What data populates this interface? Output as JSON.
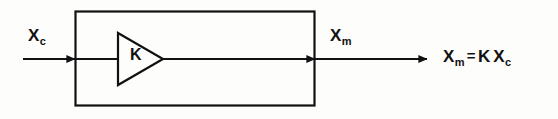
{
  "diagram": {
    "type": "block-diagram",
    "background_color": "#fdfdfc",
    "stroke_color": "#111111",
    "input": {
      "label_base": "X",
      "label_sub": "c",
      "label_full": "X_c",
      "arrow_direction": "right"
    },
    "block": {
      "shape": "rectangle",
      "x": 75,
      "y": 11,
      "width": 240,
      "height": 95,
      "element": {
        "shape": "triangle",
        "semantic": "amplifier",
        "gain_symbol": "K"
      }
    },
    "output": {
      "label_base": "X",
      "label_sub": "m",
      "label_full": "X_m",
      "arrow_direction": "right"
    },
    "equation": {
      "lhs_base": "X",
      "lhs_sub": "m",
      "operator": "=",
      "gain": "K",
      "rhs_base": "X",
      "rhs_sub": "c",
      "full": "X_m = K X_c"
    }
  }
}
